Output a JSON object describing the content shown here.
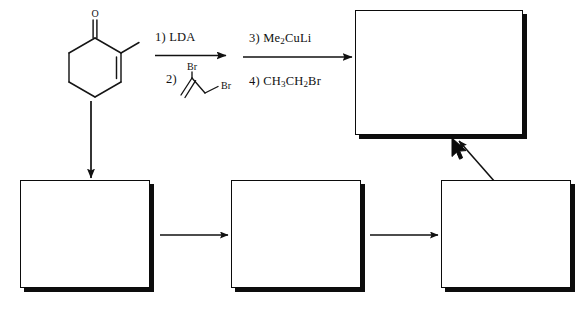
{
  "scheme": {
    "title": "Multi-step synthesis scheme with blank answer boxes",
    "type": "organic-reaction-scheme",
    "line_color": "#111111",
    "box_fill": "#ffffff",
    "box_border_color": "#0b0b0b",
    "box_shadow_color": "#0d0d0d"
  },
  "starting_material": {
    "name": "2-methylcyclohex-2-en-1-one",
    "oxygen_label": "O",
    "features": [
      "ketone",
      "cyclohexene ring",
      "methyl substituent",
      "C2=C3 double bond"
    ]
  },
  "steps": [
    {
      "id": "step-1",
      "arrow": "forward-arrow",
      "above": "1) LDA",
      "above_number": "1)",
      "above_reagent": "LDA",
      "below_number": "2)",
      "below_structure": "2,3-dibromoprop-1-ene",
      "below_labels": [
        "Br",
        "Br"
      ]
    },
    {
      "id": "step-2",
      "arrow": "forward-arrow",
      "above_number": "3)",
      "above_reagent": "Me2CuLi",
      "above_reagent_parts": [
        "Me",
        "2",
        "CuLi"
      ],
      "below_number": "4)",
      "below_reagent": "CH3CH2Br",
      "below_reagent_parts": [
        "CH",
        "3",
        "CH",
        "2",
        "Br"
      ]
    }
  ],
  "answer_boxes": [
    {
      "id": "box-product-final",
      "label": "",
      "position": "top-right",
      "role": "final product"
    },
    {
      "id": "box-intermediate-1",
      "label": "",
      "position": "bottom-left",
      "role": "intermediate 1"
    },
    {
      "id": "box-intermediate-2",
      "label": "",
      "position": "bottom-middle",
      "role": "intermediate 2"
    },
    {
      "id": "box-intermediate-3",
      "label": "",
      "position": "bottom-right",
      "role": "intermediate 3"
    }
  ],
  "connector_arrows": [
    {
      "id": "arrow-down-start",
      "direction": "down",
      "from": "starting-material",
      "to": "box-intermediate-1"
    },
    {
      "id": "arrow-right-1",
      "direction": "right",
      "from": "box-intermediate-1",
      "to": "box-intermediate-2"
    },
    {
      "id": "arrow-right-2",
      "direction": "right",
      "from": "box-intermediate-2",
      "to": "box-intermediate-3"
    },
    {
      "id": "arrow-diagonal-up",
      "direction": "up-right",
      "from": "box-intermediate-3",
      "to": "box-product-final"
    }
  ],
  "pointer": {
    "id": "mouse-cursor",
    "x": 452,
    "y": 140,
    "shape": "arrow"
  }
}
